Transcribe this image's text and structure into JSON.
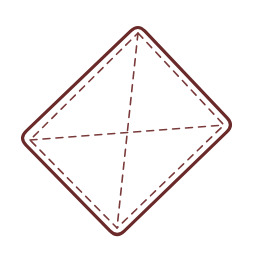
{
  "diagram": {
    "colors": {
      "outline": "#6b2a2a",
      "dashed": "#7a3a3a",
      "background": "#ffffff"
    },
    "outer_shape": {
      "vertices": [
        [
          138,
          24
        ],
        [
          234,
          125
        ],
        [
          117,
          238
        ],
        [
          19,
          138
        ]
      ],
      "stroke_width": 3.2,
      "corner_radius": 10
    },
    "inner_dashed_shape": {
      "vertices": [
        [
          138,
          33
        ],
        [
          224,
          125
        ],
        [
          117,
          228
        ],
        [
          30,
          140
        ]
      ],
      "stroke_width": 1.6,
      "dash": "7 6"
    },
    "diagonals": [
      {
        "name": "top-to-bottom",
        "from": [
          138,
          33
        ],
        "to": [
          117,
          228
        ]
      },
      {
        "name": "left-to-right",
        "from": [
          30,
          140
        ],
        "to": [
          224,
          125
        ]
      }
    ]
  }
}
